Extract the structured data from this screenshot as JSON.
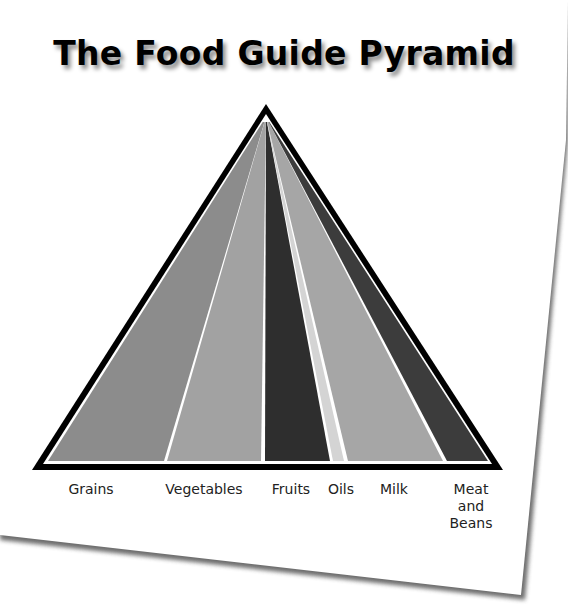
{
  "title": "The Food Guide Pyramid",
  "pyramid": {
    "apex": [
      266,
      108
    ],
    "base_left": [
      35,
      467
    ],
    "base_right": [
      500,
      467
    ],
    "outline_color": "#000000",
    "separator_color": "#ffffff"
  },
  "bands": [
    {
      "name": "Grains",
      "label": "Grains",
      "color": "#8c8c8c",
      "base_x": [
        48,
        164
      ],
      "label_x": 91
    },
    {
      "name": "Vegetables",
      "label": "Vegetables",
      "color": "#a2a2a2",
      "base_x": [
        167,
        261
      ],
      "label_x": 204
    },
    {
      "name": "Fruits",
      "label": "Fruits",
      "color": "#2e2e2e",
      "base_x": [
        265,
        330
      ],
      "label_x": 291
    },
    {
      "name": "Oils",
      "label": "Oils",
      "color": "#d4d4d4",
      "base_x": [
        333,
        344
      ],
      "label_x": 341
    },
    {
      "name": "Milk",
      "label": "Milk",
      "color": "#a6a6a6",
      "base_x": [
        348,
        443
      ],
      "label_x": 394
    },
    {
      "name": "Meat and Beans",
      "label": "Meat\nand\nBeans",
      "color": "#3c3c3c",
      "base_x": [
        447,
        488
      ],
      "label_x": 471
    }
  ],
  "chart_data": {
    "type": "diagram",
    "title": "The Food Guide Pyramid",
    "segments": [
      "Grains",
      "Vegetables",
      "Fruits",
      "Oils",
      "Milk",
      "Meat and Beans"
    ],
    "relative_widths": [
      116,
      94,
      65,
      11,
      95,
      41
    ]
  }
}
